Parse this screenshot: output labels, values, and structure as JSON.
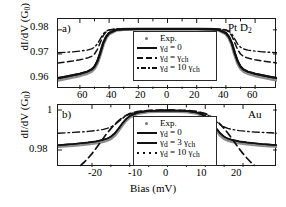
{
  "figure": {
    "type": "two-panel-line-plot",
    "shared_xlabel": "Bias (mV)",
    "ylabel": "dI/dV (G",
    "ylabel_sub": "0",
    "ylabel_close": ")"
  },
  "panel_a": {
    "tag": "a)",
    "sample_label_main": "Pt D",
    "sample_label_sub": "2",
    "y_ticks": [
      "0.98",
      "0.97",
      "0.96"
    ],
    "x_ticks": [
      "60",
      "40",
      "20",
      "0",
      "20",
      "40",
      "60"
    ],
    "legend": [
      {
        "style": "marker",
        "text": "Exp."
      },
      {
        "style": "solid",
        "text": "γ",
        "sub": "d",
        "rest": " = 0"
      },
      {
        "style": "dash",
        "text": "γ",
        "sub": "d",
        "rest": " = γ",
        "rest_sub": "ch"
      },
      {
        "style": "dashdot",
        "text": "γ",
        "sub": "d",
        "rest": " = 10 γ",
        "rest_sub": "ch"
      }
    ]
  },
  "panel_b": {
    "tag": "b)",
    "sample_label_main": "Au",
    "y_ticks": [
      "1",
      "0.98"
    ],
    "x_ticks": [
      "-20",
      "-10",
      "0",
      "10",
      "20"
    ],
    "xlabel": "Bias (mV)",
    "legend": [
      {
        "style": "marker",
        "text": "Exp."
      },
      {
        "style": "solid",
        "text": "γ",
        "sub": "d",
        "rest": " = 0"
      },
      {
        "style": "solidthick",
        "text": "γ",
        "sub": "d",
        "rest": " = 3 γ",
        "rest_sub": "ch"
      },
      {
        "style": "dots",
        "text": "γ",
        "sub": "d",
        "rest": " = 10 γ",
        "rest_sub": "ch"
      }
    ]
  },
  "chart_data": {
    "type": "line",
    "title": "",
    "panels": [
      {
        "id": "a",
        "label": "Pt D2",
        "xlabel": "Bias (mV)",
        "ylabel": "dI/dV (G0)",
        "xlim": [
          -75,
          75
        ],
        "ylim": [
          0.9555,
          0.9845
        ],
        "xticks": [
          -60,
          -40,
          -20,
          0,
          20,
          40,
          60
        ],
        "xticklabels": [
          "60",
          "40",
          "20",
          "0",
          "20",
          "40",
          "60"
        ],
        "yticks": [
          0.96,
          0.97,
          0.98
        ],
        "grid": false,
        "legend_position": "center",
        "series": [
          {
            "name": "Exp.",
            "style": "markers-gray",
            "x": [
              -75,
              -70,
              -65,
              -60,
              -55,
              -52,
              -50,
              -48,
              -46,
              -44,
              -42,
              -40,
              -35,
              -30,
              -20,
              -10,
              0,
              10,
              20,
              30,
              35,
              40,
              42,
              44,
              46,
              48,
              50,
              52,
              55,
              60,
              65,
              70,
              75
            ],
            "y": [
              0.9592,
              0.9598,
              0.9604,
              0.9611,
              0.962,
              0.9629,
              0.9641,
              0.9664,
              0.97,
              0.9741,
              0.9768,
              0.9784,
              0.9799,
              0.9802,
              0.9803,
              0.9803,
              0.9803,
              0.9803,
              0.9803,
              0.9802,
              0.9799,
              0.9784,
              0.9768,
              0.9741,
              0.97,
              0.9664,
              0.9641,
              0.9629,
              0.962,
              0.9611,
              0.9604,
              0.9598,
              0.9592
            ]
          },
          {
            "name": "gamma_d = 0",
            "style": "solid",
            "x": [
              -75,
              -70,
              -65,
              -60,
              -55,
              -52,
              -50,
              -48,
              -46,
              -44,
              -42,
              -40,
              -35,
              -30,
              -20,
              -10,
              0,
              10,
              20,
              30,
              35,
              40,
              42,
              44,
              46,
              48,
              50,
              52,
              55,
              60,
              65,
              70,
              75
            ],
            "y": [
              0.96,
              0.9606,
              0.9612,
              0.9618,
              0.9627,
              0.9636,
              0.9648,
              0.9671,
              0.9706,
              0.9746,
              0.9772,
              0.9787,
              0.98,
              0.9803,
              0.9804,
              0.9804,
              0.9804,
              0.9804,
              0.9804,
              0.9803,
              0.98,
              0.9787,
              0.9772,
              0.9746,
              0.9706,
              0.9671,
              0.9648,
              0.9636,
              0.9627,
              0.9618,
              0.9612,
              0.9606,
              0.96
            ]
          },
          {
            "name": "gamma_d = gamma_ch",
            "style": "dashed",
            "x": [
              -75,
              -70,
              -65,
              -60,
              -55,
              -52,
              -50,
              -48,
              -46,
              -44,
              -42,
              -40,
              -35,
              -30,
              -20,
              -10,
              0,
              10,
              20,
              30,
              35,
              40,
              42,
              44,
              46,
              48,
              50,
              52,
              55,
              60,
              65,
              70,
              75
            ],
            "y": [
              0.9663,
              0.9667,
              0.9671,
              0.9676,
              0.9683,
              0.969,
              0.97,
              0.9719,
              0.9748,
              0.9776,
              0.9792,
              0.9799,
              0.9803,
              0.9804,
              0.9804,
              0.9804,
              0.9804,
              0.9804,
              0.9804,
              0.9804,
              0.9803,
              0.9799,
              0.9792,
              0.9776,
              0.9748,
              0.9719,
              0.97,
              0.969,
              0.9683,
              0.9676,
              0.9671,
              0.9667,
              0.9663
            ]
          },
          {
            "name": "gamma_d = 10 gamma_ch",
            "style": "dashdot",
            "x": [
              -75,
              -70,
              -65,
              -60,
              -55,
              -52,
              -50,
              -48,
              -46,
              -44,
              -42,
              -40,
              -35,
              -30,
              -20,
              -10,
              0,
              10,
              20,
              30,
              35,
              40,
              42,
              44,
              46,
              48,
              50,
              52,
              55,
              60,
              65,
              70,
              75
            ],
            "y": [
              0.9705,
              0.9707,
              0.9709,
              0.9712,
              0.9716,
              0.9721,
              0.9728,
              0.9742,
              0.9763,
              0.9784,
              0.9795,
              0.98,
              0.9804,
              0.9804,
              0.9804,
              0.9804,
              0.9804,
              0.9804,
              0.9804,
              0.9804,
              0.9804,
              0.98,
              0.9795,
              0.9784,
              0.9763,
              0.9742,
              0.9728,
              0.9721,
              0.9716,
              0.9712,
              0.9709,
              0.9707,
              0.9705
            ]
          }
        ]
      },
      {
        "id": "b",
        "label": "Au",
        "xlabel": "Bias (mV)",
        "ylabel": "dI/dV (G0)",
        "xlim": [
          -29,
          29
        ],
        "ylim": [
          0.9715,
          1.0025
        ],
        "xticks": [
          -20,
          -10,
          0,
          10,
          20
        ],
        "yticks": [
          0.98,
          1.0
        ],
        "yticklabels": [
          "0.98",
          "1"
        ],
        "grid": false,
        "legend_position": "center",
        "series": [
          {
            "name": "Exp.",
            "style": "markers-gray",
            "x": [
              -29,
              -27,
              -25,
              -23,
              -21,
              -19,
              -17,
              -16,
              -15,
              -14,
              -13,
              -12,
              -11,
              -10,
              -8,
              -5,
              0,
              5,
              8,
              10,
              11,
              12,
              13,
              14,
              15,
              16,
              17,
              19,
              21,
              23,
              25,
              27,
              29
            ],
            "y": [
              0.9818,
              0.9821,
              0.9824,
              0.9827,
              0.9831,
              0.9836,
              0.9843,
              0.9849,
              0.9858,
              0.9874,
              0.9898,
              0.9925,
              0.9948,
              0.9965,
              0.9983,
              0.9992,
              0.9995,
              0.9992,
              0.9983,
              0.9965,
              0.9948,
              0.9925,
              0.9898,
              0.9874,
              0.9858,
              0.9849,
              0.9843,
              0.9836,
              0.9831,
              0.9827,
              0.9824,
              0.9821,
              0.9818
            ]
          },
          {
            "name": "gamma_d = 0",
            "style": "solid-thin",
            "x": [
              -29,
              -27,
              -25,
              -23,
              -21,
              -19,
              -17,
              -16,
              -15,
              -14,
              -13,
              -12,
              -11,
              -10,
              -8,
              -5,
              0,
              5,
              8,
              10,
              11,
              12,
              13,
              14,
              15,
              16,
              17,
              19,
              21,
              23,
              25,
              27,
              29
            ],
            "y": [
              0.9824,
              0.9827,
              0.983,
              0.9834,
              0.9838,
              0.9843,
              0.9851,
              0.9857,
              0.9867,
              0.9883,
              0.9906,
              0.9932,
              0.9954,
              0.997,
              0.9986,
              0.9995,
              0.9998,
              0.9995,
              0.9986,
              0.997,
              0.9954,
              0.9932,
              0.9906,
              0.9883,
              0.9867,
              0.9857,
              0.9851,
              0.9843,
              0.9838,
              0.9834,
              0.983,
              0.9827,
              0.9824
            ]
          },
          {
            "name": "gamma_d = 3 gamma_ch",
            "style": "dashed-steep",
            "x": [
              -23,
              -22,
              -21,
              -20,
              -19,
              -18,
              -17,
              -16,
              -15,
              -14,
              -13,
              -12,
              -11,
              -10,
              -8,
              -5,
              0,
              5,
              8,
              10,
              11,
              12,
              13,
              14,
              15,
              16,
              17,
              18,
              19,
              20,
              21,
              22,
              23
            ],
            "y": [
              0.9723,
              0.974,
              0.976,
              0.9782,
              0.9806,
              0.9832,
              0.9859,
              0.9884,
              0.9907,
              0.9928,
              0.9946,
              0.9961,
              0.9973,
              0.9982,
              0.9992,
              0.9998,
              1.0,
              0.9998,
              0.9992,
              0.9982,
              0.9973,
              0.9961,
              0.9946,
              0.9928,
              0.9907,
              0.9884,
              0.9859,
              0.9832,
              0.9806,
              0.9782,
              0.976,
              0.974,
              0.9723
            ]
          },
          {
            "name": "gamma_d = 10 gamma_ch",
            "style": "dashdot-upper",
            "x": [
              -29,
              -27,
              -25,
              -23,
              -21,
              -19,
              -17,
              -16,
              -15,
              -14,
              -13,
              -12,
              -11,
              -10,
              -8,
              -5,
              0,
              5,
              8,
              10,
              11,
              12,
              13,
              14,
              15,
              16,
              17,
              19,
              21,
              23,
              25,
              27,
              29
            ],
            "y": [
              0.9884,
              0.9886,
              0.9888,
              0.989,
              0.9893,
              0.9897,
              0.9903,
              0.9908,
              0.9915,
              0.9926,
              0.9941,
              0.9957,
              0.9971,
              0.998,
              0.9991,
              0.9997,
              0.9999,
              0.9997,
              0.9991,
              0.998,
              0.9971,
              0.9957,
              0.9941,
              0.9926,
              0.9915,
              0.9908,
              0.9903,
              0.9897,
              0.9893,
              0.989,
              0.9888,
              0.9886,
              0.9884
            ]
          }
        ]
      }
    ]
  }
}
